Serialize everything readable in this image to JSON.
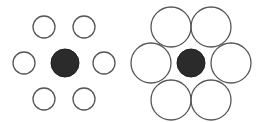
{
  "diagram": {
    "colors": {
      "background": "#ffffff",
      "center_fill": "#2b2b2b",
      "outline": "#555555"
    },
    "left_figure": {
      "center": {
        "cx": 65,
        "cy": 63,
        "r": 14
      },
      "surround_radius": 11,
      "surround": [
        {
          "cx": 44,
          "cy": 27
        },
        {
          "cx": 84,
          "cy": 27
        },
        {
          "cx": 24,
          "cy": 63
        },
        {
          "cx": 104,
          "cy": 63
        },
        {
          "cx": 44,
          "cy": 99
        },
        {
          "cx": 84,
          "cy": 99
        }
      ]
    },
    "right_figure": {
      "center": {
        "cx": 191,
        "cy": 63,
        "r": 14
      },
      "surround_radius": 20,
      "surround": [
        {
          "cx": 171,
          "cy": 27
        },
        {
          "cx": 211,
          "cy": 27
        },
        {
          "cx": 151,
          "cy": 63
        },
        {
          "cx": 231,
          "cy": 63
        },
        {
          "cx": 171,
          "cy": 100
        },
        {
          "cx": 211,
          "cy": 100
        }
      ]
    }
  }
}
